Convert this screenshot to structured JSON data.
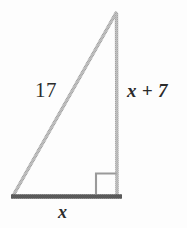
{
  "figure": {
    "kind": "right-triangle-diagram",
    "background_color": "#fdfdfd",
    "canvas": {
      "width": 187,
      "height": 228
    },
    "colors": {
      "leg_stroke": "#b4b4b4",
      "base_stroke": "#595959",
      "right_angle_stroke": "#9a9a9a",
      "label_text": "#2b2b2b"
    },
    "vertices": {
      "apex": {
        "x": 116,
        "y": 12
      },
      "bottom_left": {
        "x": 13,
        "y": 196
      },
      "bottom_right": {
        "x": 117,
        "y": 196
      }
    },
    "base_extent": {
      "x1": 11,
      "x2": 122,
      "y": 196
    },
    "right_angle_marker": {
      "x": 96,
      "y": 173,
      "size": 21
    },
    "labels": {
      "hypotenuse": "17",
      "vertical_leg": "x + 7",
      "base": "x"
    }
  }
}
